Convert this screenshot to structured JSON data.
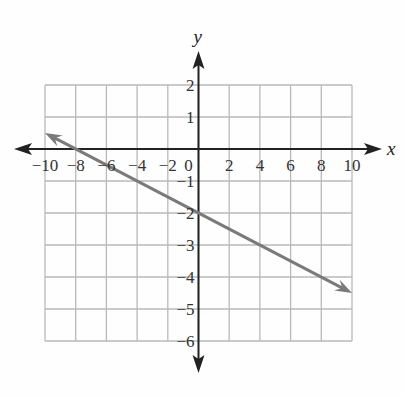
{
  "chart_data": {
    "type": "line",
    "title": "",
    "xlabel": "x",
    "ylabel": "y",
    "xlim": [
      -10,
      10
    ],
    "ylim": [
      -6,
      2
    ],
    "grid": true,
    "x_ticks": [
      -10,
      -8,
      -6,
      -4,
      -2,
      0,
      2,
      4,
      6,
      8,
      10
    ],
    "x_tick_labels": [
      "−10",
      "−8",
      "−6",
      "−4",
      "−2",
      "0",
      "2",
      "4",
      "6",
      "8",
      "10"
    ],
    "y_ticks": [
      2,
      1,
      -1,
      -2,
      -3,
      -4,
      -5,
      -6
    ],
    "y_tick_labels": [
      "2",
      "1",
      "−1",
      "−2",
      "−3",
      "−4",
      "−5",
      "−6"
    ],
    "series": [
      {
        "name": "line",
        "equation": "y = -1/4 x - 2",
        "x": [
          -10,
          10
        ],
        "y": [
          0.5,
          -4.5
        ],
        "color": "#7a7a7a",
        "arrows_both_ends": true
      }
    ]
  },
  "colors": {
    "grid": "#b9b9b9",
    "axes": "#222222",
    "line": "#7a7a7a"
  }
}
